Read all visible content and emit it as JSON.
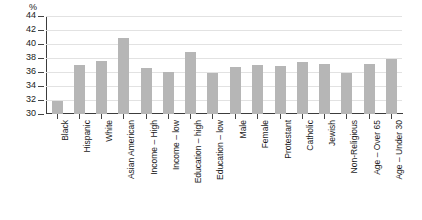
{
  "chart_data": {
    "type": "bar",
    "title": "",
    "xlabel": "",
    "ylabel": "%",
    "ylim": [
      30,
      44
    ],
    "ytick_step": 2,
    "yticks": [
      44,
      42,
      40,
      38,
      36,
      34,
      32,
      30
    ],
    "grid": true,
    "legend": "none",
    "bar_color": "#b6b6b6",
    "axis_color": "#3c3c3c",
    "grid_color": "#e2e2e2",
    "categories": [
      "Black",
      "Hispanic",
      "White",
      "Asian American",
      "Income – High",
      "Income – low",
      "Education – high",
      "Education – low",
      "Male",
      "Female",
      "Protestant",
      "Catholic",
      "Jewish",
      "Non-Religious",
      "Age – Over 65",
      "Age – Under 30"
    ],
    "values": [
      31.9,
      37.0,
      37.6,
      40.8,
      36.6,
      36.0,
      38.8,
      35.8,
      36.7,
      37.0,
      36.8,
      37.5,
      37.2,
      35.9,
      37.1,
      37.8
    ],
    "groups": [
      {
        "name": "race",
        "categories": [
          "Black",
          "Hispanic",
          "White",
          "Asian American"
        ]
      },
      {
        "name": "income-education",
        "categories": [
          "Income – High",
          "Income – low",
          "Education – high",
          "Education – low"
        ]
      },
      {
        "name": "gender",
        "categories": [
          "Male",
          "Female"
        ]
      },
      {
        "name": "religion",
        "categories": [
          "Protestant",
          "Catholic",
          "Jewish",
          "Non-Religious"
        ]
      },
      {
        "name": "age",
        "categories": [
          "Age – Over 65",
          "Age – Under 30"
        ]
      }
    ]
  }
}
